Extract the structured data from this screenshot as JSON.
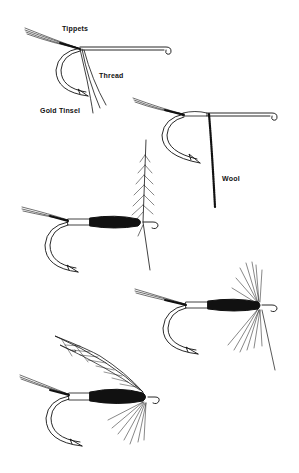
{
  "diagram": {
    "stages": [
      {
        "id": 1,
        "description": "Hook with tippets tied in, thread and gold tinsel attached"
      },
      {
        "id": 2,
        "description": "Tinsel wound, wool attached"
      },
      {
        "id": 3,
        "description": "Wool body wound, hackle tied in"
      },
      {
        "id": 4,
        "description": "Hackle wound"
      },
      {
        "id": 5,
        "description": "Finished wet fly with wing"
      }
    ],
    "labels": {
      "tippets": "Tippets",
      "thread": "Thread",
      "gold_tinsel": "Gold Tinsel",
      "wool": "Wool"
    },
    "colors": {
      "ink": "#111111",
      "background": "#ffffff"
    }
  }
}
